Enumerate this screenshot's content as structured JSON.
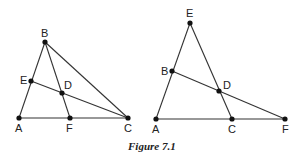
{
  "caption": "Figure 7.1",
  "figures": [
    {
      "name": "left",
      "points": {
        "A": [
          19,
          118
        ],
        "B": [
          45,
          42
        ],
        "C": [
          128,
          118
        ],
        "D": [
          62,
          93
        ],
        "E": [
          31,
          81
        ],
        "F": [
          70,
          118
        ]
      },
      "segments": [
        [
          "A",
          "B"
        ],
        [
          "B",
          "C"
        ],
        [
          "A",
          "C"
        ],
        [
          "B",
          "F"
        ],
        [
          "E",
          "C"
        ]
      ],
      "labels": {
        "A": {
          "text": "A",
          "x": 15,
          "y": 132
        },
        "B": {
          "text": "B",
          "x": 41,
          "y": 37
        },
        "C": {
          "text": "C",
          "x": 124,
          "y": 132
        },
        "D": {
          "text": "D",
          "x": 64,
          "y": 89
        },
        "E": {
          "text": "E",
          "x": 20,
          "y": 84
        },
        "F": {
          "text": "F",
          "x": 66,
          "y": 132
        }
      }
    },
    {
      "name": "right",
      "points": {
        "A": [
          156,
          119
        ],
        "B": [
          172,
          71
        ],
        "C": [
          232,
          119
        ],
        "D": [
          219,
          91
        ],
        "E": [
          190,
          23
        ],
        "F": [
          285,
          119
        ]
      },
      "segments": [
        [
          "A",
          "E"
        ],
        [
          "E",
          "C"
        ],
        [
          "A",
          "F"
        ],
        [
          "B",
          "F"
        ]
      ],
      "labels": {
        "A": {
          "text": "A",
          "x": 152,
          "y": 133
        },
        "B": {
          "text": "B",
          "x": 161,
          "y": 75
        },
        "C": {
          "text": "C",
          "x": 228,
          "y": 133
        },
        "D": {
          "text": "D",
          "x": 223,
          "y": 89
        },
        "E": {
          "text": "E",
          "x": 186,
          "y": 17
        },
        "F": {
          "text": "F",
          "x": 282,
          "y": 133
        }
      }
    }
  ]
}
